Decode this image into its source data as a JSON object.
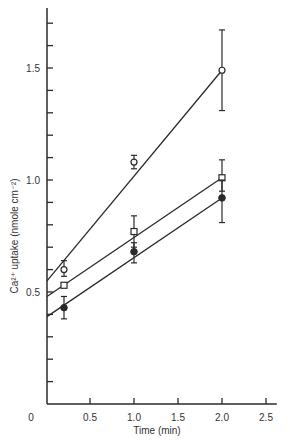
{
  "chart_data": {
    "type": "line",
    "title": "",
    "xlabel": "Time (min)",
    "ylabel": "Ca²⁺ uptake (nmole cm⁻²)",
    "xlim": [
      0,
      2.6
    ],
    "ylim": [
      0,
      1.75
    ],
    "x_ticks": [
      0.5,
      1.0,
      1.5,
      2.0,
      2.5
    ],
    "x_tick_labels": [
      "0.5",
      "1.0",
      "1.5",
      "2.0",
      "2.5"
    ],
    "origin_label": "0",
    "y_ticks_minor": [
      0.1,
      0.2,
      0.3,
      0.4,
      0.6,
      0.7,
      0.8,
      0.9,
      1.1,
      1.2,
      1.3,
      1.4,
      1.6,
      1.7
    ],
    "y_ticks_major": [
      0.5,
      1.0,
      1.5
    ],
    "y_tick_labels": [
      "0.5",
      "1.0",
      "1.5"
    ],
    "grid": false,
    "legend": null,
    "x": [
      0.25,
      1.0,
      2.0
    ],
    "series": [
      {
        "name": "open circles",
        "marker": "open-circle",
        "values": [
          0.6,
          1.08,
          1.49
        ],
        "errors_low": [
          0.57,
          1.05,
          1.31
        ],
        "errors_high": [
          0.64,
          1.11,
          1.67
        ],
        "fit_line": {
          "x0": 0.0,
          "y0": 0.55,
          "x1": 2.0,
          "y1": 1.49
        }
      },
      {
        "name": "open squares",
        "marker": "open-square",
        "values": [
          0.53,
          0.77,
          1.01
        ],
        "errors_low": [
          0.53,
          0.7,
          0.95
        ],
        "errors_high": [
          0.53,
          0.84,
          1.09
        ],
        "fit_line": {
          "x0": 0.0,
          "y0": 0.48,
          "x1": 2.0,
          "y1": 1.01
        }
      },
      {
        "name": "filled circles",
        "marker": "filled-circle",
        "values": [
          0.43,
          0.68,
          0.92
        ],
        "errors_low": [
          0.38,
          0.63,
          0.81
        ],
        "errors_high": [
          0.48,
          0.72,
          1.0
        ],
        "fit_line": {
          "x0": 0.0,
          "y0": 0.39,
          "x1": 2.0,
          "y1": 0.92
        }
      }
    ]
  }
}
